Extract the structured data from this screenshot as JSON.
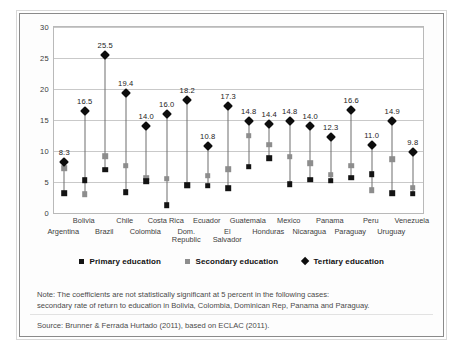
{
  "chart_data": {
    "type": "scatter",
    "title": "",
    "xlabel": "",
    "ylabel": "",
    "ylim": [
      0,
      30
    ],
    "yticks": [
      0,
      5,
      10,
      15,
      20,
      25,
      30
    ],
    "grid": true,
    "legend_position": "bottom",
    "categories": [
      "Argentina",
      "Bolivia",
      "Brazil",
      "Chile",
      "Colombia",
      "Costa Rica",
      "Dom. Republic",
      "Ecuador",
      "El Salvador",
      "Guatemala",
      "Honduras",
      "Mexico",
      "Nicaragua",
      "Panama",
      "Paraguay",
      "Peru",
      "Uruguay",
      "Venezuela"
    ],
    "series": [
      {
        "name": "Primary education",
        "marker": "square",
        "color": "#141414",
        "values": [
          3.2,
          5.3,
          7.0,
          3.4,
          5.1,
          1.3,
          4.5,
          4.4,
          4.0,
          7.5,
          8.8,
          4.6,
          5.4,
          5.2,
          5.7,
          6.3,
          3.2,
          3.1
        ]
      },
      {
        "name": "Secondary education",
        "marker": "square",
        "color": "#8d8d8d",
        "values": [
          7.2,
          3.0,
          9.2,
          7.6,
          5.7,
          5.5,
          4.5,
          6.0,
          7.1,
          12.5,
          11.0,
          9.1,
          8.0,
          6.2,
          7.6,
          3.7,
          8.7,
          4.1
        ]
      },
      {
        "name": "Tertiary education",
        "marker": "diamond",
        "color": "#0d0d0d",
        "values": [
          8.3,
          16.5,
          25.5,
          19.4,
          14.0,
          16.0,
          18.2,
          10.8,
          17.3,
          14.8,
          14.4,
          14.8,
          14.0,
          12.3,
          16.6,
          11.0,
          14.9,
          9.8
        ],
        "data_labels": [
          "8.3",
          "16.5",
          "25.5",
          "19.4",
          "14.0",
          "16.0",
          "18.2",
          "10.8",
          "17.3",
          "14.8",
          "14.4",
          "14.8",
          "14.0",
          "12.3",
          "16.6",
          "11.0",
          "14.9",
          "9.8"
        ]
      }
    ],
    "category_label_rows": [
      1,
      0,
      1,
      0,
      1,
      0,
      1,
      0,
      1,
      0,
      1,
      0,
      1,
      0,
      1,
      0,
      1,
      0
    ],
    "category_display": [
      "Argentina",
      "Bolivia",
      "Brazil",
      "Chile",
      "Colombia",
      "Costa Rica",
      "Dom. Republic",
      "Ecuador",
      "El Salvador",
      "Guatemala",
      "Honduras",
      "Mexico",
      "Nicaragua",
      "Panama",
      "Paraguay",
      "Peru",
      "Uruguay",
      "Venezuela"
    ]
  },
  "legend": {
    "items": [
      {
        "label": "Primary education",
        "swatch": "square-black-icon"
      },
      {
        "label": "Secondary education",
        "swatch": "square-gray-icon"
      },
      {
        "label": "Tertiary education",
        "swatch": "diamond-black-icon"
      }
    ]
  },
  "note": {
    "line1": "Note: The coefficients are not statistically significant at 5 percent in the following cases:",
    "line2": "secondary rate of return to education in Bolivia, Colombia, Dominican Rep, Panama and Paraguay."
  },
  "source": {
    "text": "Source: Brunner & Ferrada Hurtado (2011), based on ECLAC (2011)."
  }
}
